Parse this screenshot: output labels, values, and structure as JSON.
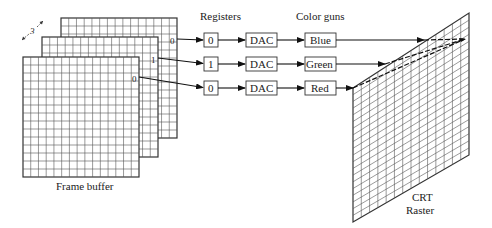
{
  "frame_buffer": {
    "label": "Frame buffer",
    "plane_count_label": "3",
    "plane_bits": [
      "0",
      "1",
      "0"
    ]
  },
  "registers": {
    "header": "Registers",
    "values": [
      "0",
      "1",
      "0"
    ]
  },
  "dacs": {
    "labels": [
      "DAC",
      "DAC",
      "DAC"
    ]
  },
  "color_guns": {
    "header": "Color guns",
    "labels": [
      "Blue",
      "Green",
      "Red"
    ]
  },
  "crt": {
    "label_line1": "CRT",
    "label_line2": "Raster"
  }
}
